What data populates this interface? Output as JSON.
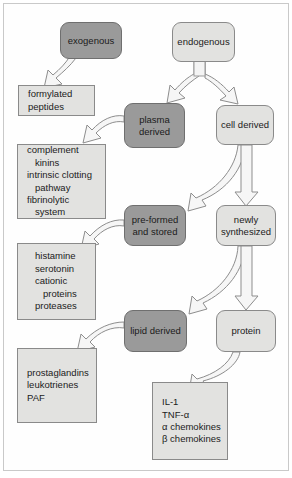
{
  "diagram": {
    "colors": {
      "dark_fill": "#9a9a9a",
      "light_fill": "#e2e2e0",
      "stroke": "#7d7d7d",
      "text": "#1b1b1b",
      "frame": "#c9c9c9",
      "arrow_fill": "#f4f4f4",
      "arrow_stroke": "#8d8d8d"
    },
    "nodes": {
      "exogenous": {
        "label": "exogenous",
        "style": "dark"
      },
      "endogenous": {
        "label": "endogenous",
        "style": "light"
      },
      "plasma_derived": {
        "label": "plasma\nderived",
        "line1": "plasma",
        "line2": "derived",
        "style": "dark"
      },
      "cell_derived": {
        "label": "cell derived",
        "style": "light"
      },
      "pre_formed": {
        "label": "pre-formed\nand stored",
        "line1": "pre-formed",
        "line2": "and stored",
        "style": "dark"
      },
      "newly_synthesized": {
        "label": "newly\nsynthesized",
        "line1": "newly",
        "line2": "synthesized",
        "style": "light"
      },
      "lipid_derived": {
        "label": "lipid derived",
        "style": "dark"
      },
      "protein": {
        "label": "protein",
        "style": "light"
      }
    },
    "lists": {
      "formylated": {
        "name": "formylated-peptides-box",
        "lines": [
          {
            "text": "formylated",
            "indent": false
          },
          {
            "text": "peptides",
            "indent": false
          }
        ]
      },
      "complement": {
        "name": "complement-kinins-box",
        "lines": [
          {
            "text": "complement",
            "indent": false
          },
          {
            "text": "kinins",
            "indent": true
          },
          {
            "text": "intrinsic clotting",
            "indent": false
          },
          {
            "text": "pathway",
            "indent": true
          },
          {
            "text": "fibrinolytic",
            "indent": false
          },
          {
            "text": "system",
            "indent": true
          }
        ]
      },
      "histamine": {
        "name": "histamine-serotonin-box",
        "lines": [
          {
            "text": "histamine",
            "indent": false
          },
          {
            "text": "serotonin",
            "indent": false
          },
          {
            "text": "cationic",
            "indent": false
          },
          {
            "text": "proteins",
            "indent": true
          },
          {
            "text": "proteases",
            "indent": false
          }
        ]
      },
      "prostaglandins": {
        "name": "prostaglandins-box",
        "lines": [
          {
            "text": "prostaglandins",
            "indent": false
          },
          {
            "text": "leukotrienes",
            "indent": false
          },
          {
            "text": "PAF",
            "indent": false
          }
        ]
      },
      "cytokines": {
        "name": "cytokines-box",
        "lines": [
          {
            "text": "IL-1",
            "indent": false
          },
          {
            "text": "TNF-α",
            "indent": false
          },
          {
            "text": "α chemokines",
            "indent": false
          },
          {
            "text": "β chemokines",
            "indent": false
          }
        ]
      }
    },
    "edges": [
      {
        "from": "exogenous",
        "to": "formylated-peptides-box",
        "kind": "block-arrow-curved"
      },
      {
        "from": "endogenous",
        "to": "plasma_derived",
        "kind": "block-arrow-split"
      },
      {
        "from": "endogenous",
        "to": "cell_derived",
        "kind": "block-arrow-split"
      },
      {
        "from": "plasma_derived",
        "to": "complement-kinins-box",
        "kind": "block-arrow-curved"
      },
      {
        "from": "cell_derived",
        "to": "pre_formed",
        "kind": "block-arrow-curved"
      },
      {
        "from": "cell_derived",
        "to": "newly_synthesized",
        "kind": "block-arrow-straight"
      },
      {
        "from": "pre_formed",
        "to": "histamine-serotonin-box",
        "kind": "block-arrow-curved"
      },
      {
        "from": "newly_synthesized",
        "to": "lipid_derived",
        "kind": "block-arrow-curved"
      },
      {
        "from": "newly_synthesized",
        "to": "protein",
        "kind": "block-arrow-straight"
      },
      {
        "from": "lipid_derived",
        "to": "prostaglandins-box",
        "kind": "block-arrow-curved"
      },
      {
        "from": "protein",
        "to": "cytokines-box",
        "kind": "block-arrow-curved"
      }
    ]
  }
}
